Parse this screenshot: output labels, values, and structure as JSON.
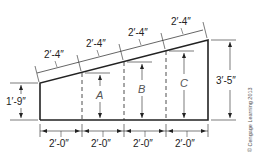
{
  "diagram": {
    "type": "shed roof wall elevation with sloped top",
    "slope_dimensions": [
      "2′-4″",
      "2′-4″",
      "2′-4″",
      "2′-4″"
    ],
    "bottom_dimensions": [
      "2′-0″",
      "2′-0″",
      "2′-0″",
      "2′-0″"
    ],
    "left_height": "1′-9″",
    "right_height": "3′-5″",
    "unknown_heights": [
      "A",
      "B",
      "C"
    ],
    "copyright": "© Cengage Learning 2013",
    "colors": {
      "line": "#222222",
      "text": "#222222",
      "letters": "#555555"
    }
  }
}
